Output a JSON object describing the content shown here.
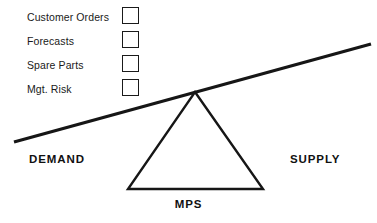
{
  "diagram": {
    "colors": {
      "line": "#161616",
      "text": "#141414",
      "background": "#ffffff"
    },
    "inputs": [
      {
        "label": "Customer Orders",
        "checkbox": "empty-checkbox",
        "checked": false
      },
      {
        "label": "Forecasts",
        "checkbox": "empty-checkbox",
        "checked": false
      },
      {
        "label": "Spare Parts",
        "checkbox": "empty-checkbox",
        "checked": false
      },
      {
        "label": "Mgt. Risk",
        "checkbox": "empty-checkbox",
        "checked": false
      }
    ],
    "left_side_label": "DEMAND",
    "right_side_label": "SUPPLY",
    "fulcrum_label": "MPS",
    "geometry": {
      "beam_left": {
        "x": 14,
        "y": 142
      },
      "beam_right": {
        "x": 371,
        "y": 44
      },
      "beam_thickness": 3.2,
      "triangle_apex": {
        "x": 195,
        "y": 92
      },
      "triangle_base_left": {
        "x": 128,
        "y": 189
      },
      "triangle_base_right": {
        "x": 263,
        "y": 189
      },
      "triangle_stroke": 2.4
    }
  }
}
